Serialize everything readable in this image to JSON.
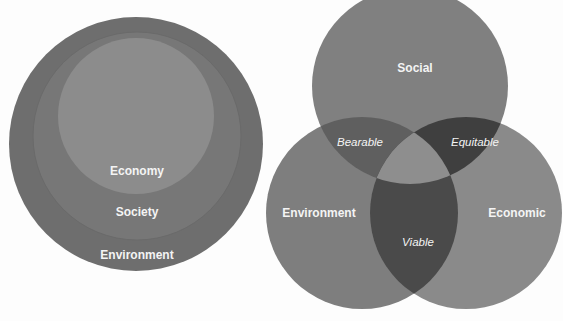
{
  "nested_diagram": {
    "labels": {
      "inner": "Economy",
      "middle": "Society",
      "outer": "Environment"
    },
    "colors": {
      "outer": "#6e6e6e",
      "middle": "#787878",
      "inner": "#8d8d8d",
      "ring": "#666666"
    }
  },
  "venn_diagram": {
    "circles": [
      {
        "label": "Social",
        "color": "#7f7f7f"
      },
      {
        "label": "Environment",
        "color": "#7f7f7f"
      },
      {
        "label": "Economic",
        "color": "#8a8a8a"
      }
    ],
    "overlaps": {
      "social_environment": "Bearable",
      "social_economic": "Equitable",
      "environment_economic": "Viable"
    },
    "colors": {
      "bearable": "#5f5f5f",
      "equitable": "#3f3f3f",
      "viable": "#4a4a4a",
      "center": "#8e8e8e"
    }
  }
}
